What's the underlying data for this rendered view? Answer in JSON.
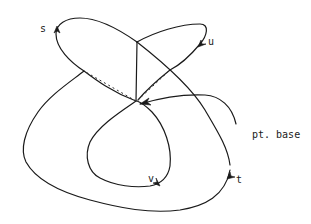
{
  "diagram": {
    "type": "loop-diagram",
    "colors": {
      "stroke": "#1a1a1a",
      "background": "#ffffff"
    },
    "labels": {
      "s": "s",
      "u": "u",
      "v": "v",
      "t": "t",
      "base": "pt. base"
    },
    "base_point": {
      "x": 137,
      "y": 102
    },
    "loops": [
      {
        "name": "s",
        "label_pos": {
          "x": 40,
          "y": 24
        }
      },
      {
        "name": "u",
        "label_pos": {
          "x": 208,
          "y": 37
        }
      },
      {
        "name": "v",
        "label_pos": {
          "x": 148,
          "y": 174
        }
      },
      {
        "name": "t",
        "label_pos": {
          "x": 236,
          "y": 175
        }
      }
    ],
    "base_label_pos": {
      "x": 252,
      "y": 130
    }
  }
}
